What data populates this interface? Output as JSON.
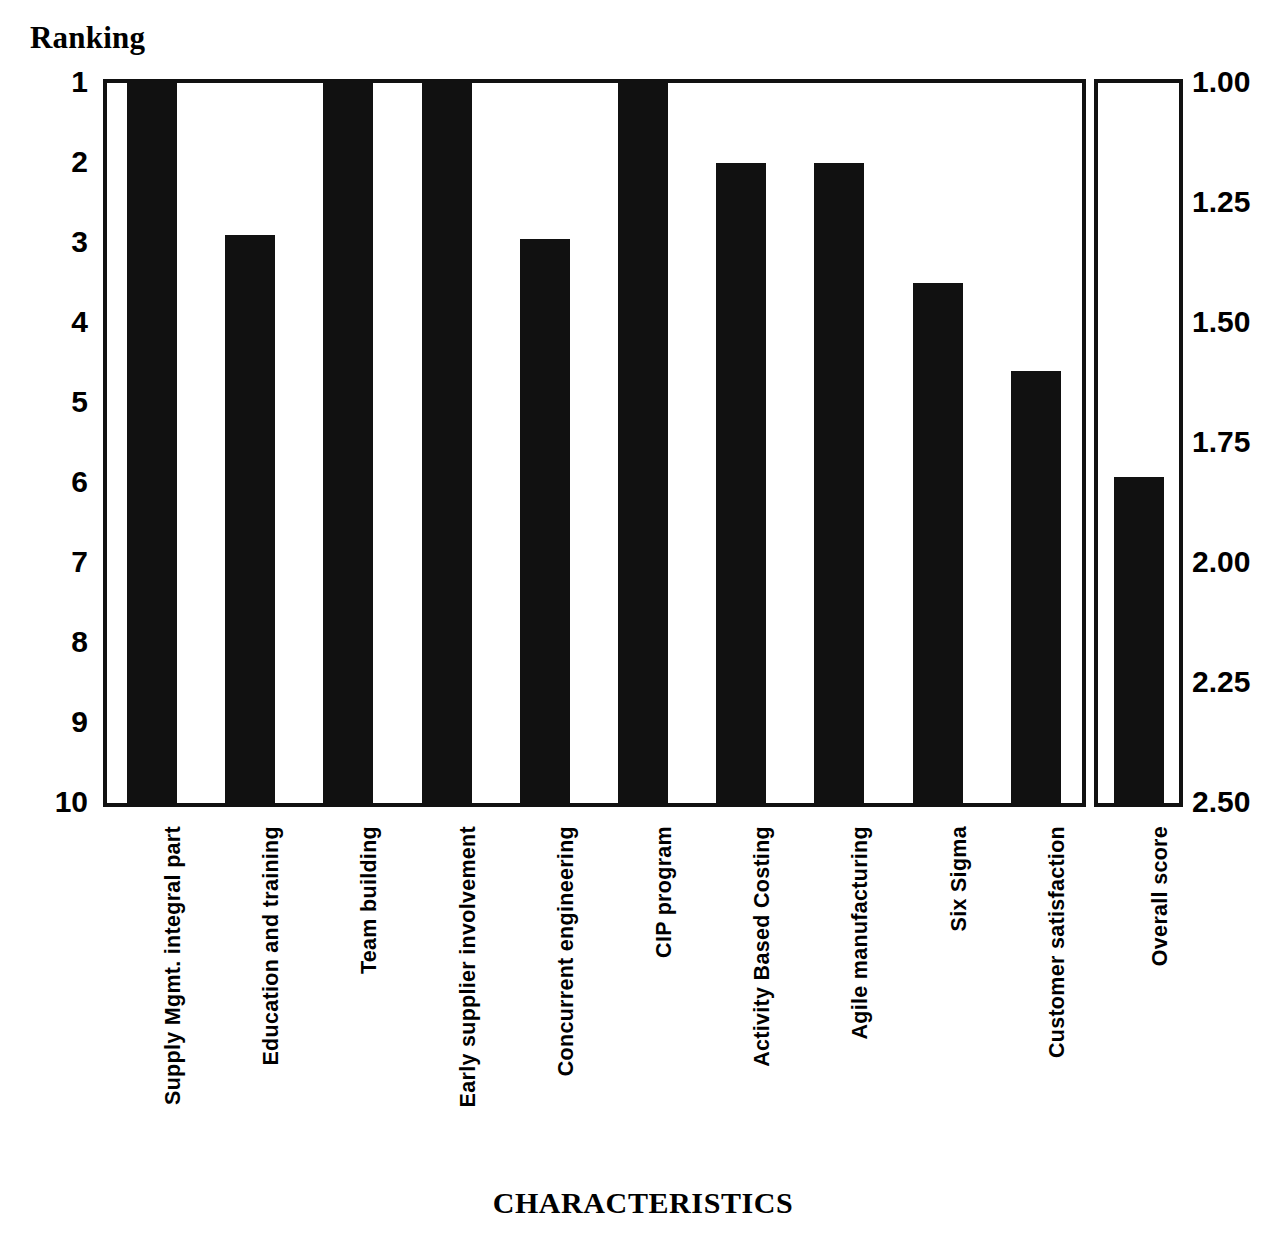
{
  "chart_data": {
    "type": "bar",
    "title": "",
    "xlabel": "CHARACTERISTICS",
    "ylabel": "Ranking",
    "secondary_ylabel": "",
    "grid": false,
    "legend": null,
    "y_axis_left": {
      "label": "Ranking",
      "ticks": [
        "1",
        "2",
        "3",
        "4",
        "5",
        "6",
        "7",
        "8",
        "9",
        "10"
      ],
      "values": [
        1,
        2,
        3,
        4,
        5,
        6,
        7,
        8,
        9,
        10
      ],
      "min": 1,
      "max": 10,
      "inverted": true
    },
    "y_axis_right": {
      "ticks": [
        "1.00",
        "1.25",
        "1.50",
        "1.75",
        "2.00",
        "2.25",
        "2.50"
      ],
      "values": [
        1.0,
        1.25,
        1.5,
        1.75,
        2.0,
        2.25,
        2.5
      ],
      "min": 1.0,
      "max": 2.5,
      "inverted": true
    },
    "categories": [
      "Supply Mgmt. integral part",
      "Education and training",
      "Team building",
      "Early supplier involvement",
      "Concurrent engineering",
      "CIP program",
      "Activity Based Costing",
      "Agile manufacturing",
      "Six Sigma",
      "Customer satisfaction"
    ],
    "values": [
      1,
      2.9,
      1,
      1,
      2.95,
      1,
      2,
      2,
      3.5,
      4.6
    ],
    "overall": {
      "category": "Overall score",
      "value": 1.82,
      "scale": "right"
    }
  },
  "axis": {
    "ranking_caption": "Ranking",
    "x_title": "CHARACTERISTICS"
  },
  "left_ticks": [
    {
      "label": "1",
      "value": 1
    },
    {
      "label": "2",
      "value": 2
    },
    {
      "label": "3",
      "value": 3
    },
    {
      "label": "4",
      "value": 4
    },
    {
      "label": "5",
      "value": 5
    },
    {
      "label": "6",
      "value": 6
    },
    {
      "label": "7",
      "value": 7
    },
    {
      "label": "8",
      "value": 8
    },
    {
      "label": "9",
      "value": 9
    },
    {
      "label": "10",
      "value": 10
    }
  ],
  "right_ticks": [
    {
      "label": "1.00",
      "value": 1.0
    },
    {
      "label": "1.25",
      "value": 1.25
    },
    {
      "label": "1.50",
      "value": 1.5
    },
    {
      "label": "1.75",
      "value": 1.75
    },
    {
      "label": "2.00",
      "value": 2.0
    },
    {
      "label": "2.25",
      "value": 2.25
    },
    {
      "label": "2.50",
      "value": 2.5
    }
  ],
  "bars": [
    {
      "label": "Supply Mgmt. integral part",
      "value": 1
    },
    {
      "label": "Education and training",
      "value": 2.9
    },
    {
      "label": "Team building",
      "value": 1
    },
    {
      "label": "Early supplier involvement",
      "value": 1
    },
    {
      "label": "Concurrent engineering",
      "value": 2.95
    },
    {
      "label": "CIP program",
      "value": 1
    },
    {
      "label": "Activity Based Costing",
      "value": 2
    },
    {
      "label": "Agile manufacturing",
      "value": 2
    },
    {
      "label": "Six Sigma",
      "value": 3.5
    },
    {
      "label": "Customer satisfaction",
      "value": 4.6
    }
  ],
  "overall_bar": {
    "label": "Overall score",
    "value": 1.82
  }
}
